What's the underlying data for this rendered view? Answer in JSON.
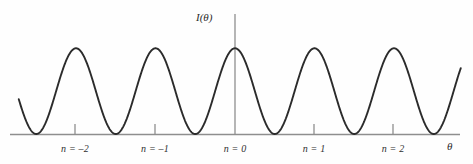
{
  "figure": {
    "title": "",
    "y_axis_label": "I(θ)",
    "x_axis_label": "θ",
    "background_color": "#fefefe",
    "curve_color": "#2b2b2b",
    "axis_color": "#8e8e8e",
    "text_color": "#2f2f2f"
  },
  "chart_data": {
    "type": "line",
    "title": "",
    "subtitle": "",
    "xlabel": "θ",
    "ylabel": "I(θ)",
    "xlim": [
      -2.72,
      2.84
    ],
    "ylim": [
      0,
      1.05
    ],
    "grid": false,
    "legend": null,
    "tick_labels": [
      "n = –2",
      "n = –1",
      "n = 0",
      "n = 1",
      "n = 2"
    ],
    "tick_positions": [
      -2,
      -1,
      0,
      1,
      2
    ],
    "peaks": [
      {
        "order": "n = –2",
        "x": -2,
        "y": 1.0
      },
      {
        "order": "n = –1",
        "x": -1,
        "y": 1.0
      },
      {
        "order": "n = 0",
        "x": 0,
        "y": 1.0
      },
      {
        "order": "n = 1",
        "x": 1,
        "y": 1.0
      },
      {
        "order": "n = 2",
        "x": 2,
        "y": 1.0
      }
    ],
    "minima": [
      -2.5,
      -1.5,
      -0.5,
      0.5,
      1.5,
      2.5
    ],
    "series": [
      {
        "name": "I(θ)",
        "formula": "cos^2(pi * x)",
        "x": [
          -2.72,
          -2.6,
          -2.5,
          -2.4,
          -2.3,
          -2.2,
          -2.1,
          -2.0,
          -1.9,
          -1.8,
          -1.7,
          -1.6,
          -1.5,
          -1.4,
          -1.3,
          -1.2,
          -1.1,
          -1.0,
          -0.9,
          -0.8,
          -0.7,
          -0.6,
          -0.5,
          -0.4,
          -0.3,
          -0.2,
          -0.1,
          0.0,
          0.1,
          0.2,
          0.3,
          0.4,
          0.5,
          0.6,
          0.7,
          0.8,
          0.9,
          1.0,
          1.1,
          1.2,
          1.3,
          1.4,
          1.5,
          1.6,
          1.7,
          1.8,
          1.9,
          2.0,
          2.1,
          2.2,
          2.3,
          2.4,
          2.5,
          2.6,
          2.7,
          2.84
        ],
        "values": [
          0.45,
          0.1,
          0.0,
          0.1,
          0.35,
          0.65,
          0.9,
          1.0,
          0.9,
          0.65,
          0.35,
          0.1,
          0.0,
          0.1,
          0.35,
          0.65,
          0.9,
          1.0,
          0.9,
          0.65,
          0.35,
          0.1,
          0.0,
          0.1,
          0.35,
          0.65,
          0.9,
          1.0,
          0.9,
          0.65,
          0.35,
          0.1,
          0.0,
          0.1,
          0.35,
          0.65,
          0.9,
          1.0,
          0.9,
          0.65,
          0.35,
          0.1,
          0.0,
          0.1,
          0.35,
          0.65,
          0.9,
          1.0,
          0.9,
          0.65,
          0.35,
          0.1,
          0.0,
          0.1,
          0.35,
          0.72
        ]
      }
    ]
  },
  "axis_ticks": [
    {
      "label": "n = –2",
      "x_px": 75
    },
    {
      "label": "n = –1",
      "x_px": 155
    },
    {
      "label": "n = 0",
      "x_px": 235
    },
    {
      "label": "n = 1",
      "x_px": 314
    },
    {
      "label": "n = 2",
      "x_px": 393
    }
  ]
}
